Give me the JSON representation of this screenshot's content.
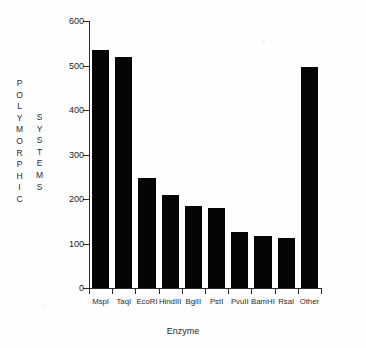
{
  "chart_data": {
    "type": "bar",
    "title": "",
    "categories": [
      "MspI",
      "TaqI",
      "EcoRI",
      "HindIII",
      "BglII",
      "PstI",
      "PvuII",
      "BamHI",
      "RsaI",
      "Other"
    ],
    "values": [
      535,
      520,
      248,
      208,
      185,
      180,
      126,
      117,
      112,
      497
    ],
    "xlabel": "Enzyme",
    "ylabel": "POLYMORPHIC SYSTEMS",
    "ylabel_columns": [
      "POLYMORPHIC",
      "SYSTEMS"
    ],
    "ylim": [
      0,
      600
    ],
    "yticks": [
      0,
      100,
      200,
      300,
      400,
      500,
      600
    ],
    "ytick_labels": [
      "0",
      "100",
      "200",
      "300",
      "400",
      "500",
      "600"
    ],
    "grid": false,
    "legend": null,
    "bar_color": "#050505",
    "axis_color": "#2b2b2b",
    "background_color": "#ffffff"
  }
}
